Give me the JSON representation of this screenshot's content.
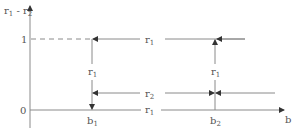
{
  "diagram": {
    "y_axis": {
      "label": "r1 - r2",
      "label_main": "r",
      "label_sub1": "1",
      "label_mid": " - r",
      "label_sub2": "2"
    },
    "x_axis": {
      "label": "b"
    },
    "ticks": {
      "one": "1",
      "zero": "0"
    },
    "points": {
      "b1": {
        "main": "b",
        "sub": "1"
      },
      "b2": {
        "main": "b",
        "sub": "2"
      }
    },
    "edges": {
      "top_line": {
        "main": "r",
        "sub": "1"
      },
      "middle_line": {
        "main": "r",
        "sub": "2"
      },
      "bottom_line": {
        "main": "r",
        "sub": "1"
      },
      "left_drop": {
        "main": "r",
        "sub": "1"
      },
      "right_rise": {
        "main": "r",
        "sub": "1"
      }
    },
    "colors": {
      "line": "#8a8a8a",
      "text": "#555555",
      "arrow": "#333333"
    }
  }
}
